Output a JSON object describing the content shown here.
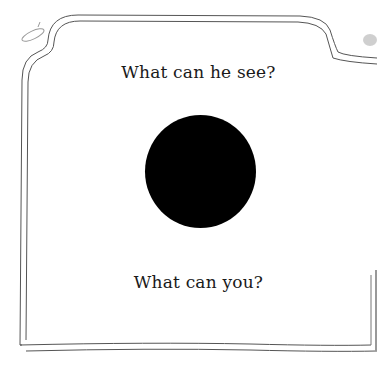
{
  "page": {
    "caption_top": "What can he see?",
    "caption_bottom": "What can you?",
    "illustration": "black-circle",
    "colors": {
      "background": "#ffffff",
      "border": "#555555",
      "circle": "#000000",
      "text": "#1a1a1a"
    }
  }
}
